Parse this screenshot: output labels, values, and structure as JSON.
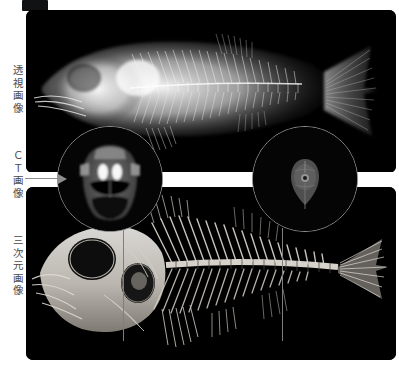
{
  "figure": {
    "caption_badge": "",
    "background_color": "#ffffff",
    "panel_background": "#000000",
    "accent_line_color": "#8f8f8f"
  },
  "row_labels": [
    {
      "id": "xray",
      "text": "透視画像",
      "meaning": "transmission (X-ray) image"
    },
    {
      "id": "ct",
      "text": "ＣＴ画像",
      "meaning": "CT image"
    },
    {
      "id": "three_d",
      "text": "三次元画像",
      "meaning": "three-dimensional image"
    }
  ],
  "panels": [
    {
      "id": "panel-xray",
      "label": "透視画像",
      "modality": "x-ray radiograph",
      "subject": "whole fish, lateral view, head at left, tail at right"
    },
    {
      "id": "panel-3d",
      "label": "三次元画像",
      "modality": "3D volume-rendered CT",
      "subject": "fish skeleton, lateral view, head at left, tail at right"
    }
  ],
  "ct_slices": [
    {
      "id": "ct-circle-head",
      "label": "",
      "description": "axial CT cross-section through the fish head showing eyes and cranium",
      "links_to": "connector-head"
    },
    {
      "id": "ct-circle-body",
      "label": "",
      "description": "axial CT cross-section through the fish body showing vertebra",
      "links_to": "connector-body"
    }
  ],
  "icons": {
    "arrow": "arrow-right-icon"
  }
}
